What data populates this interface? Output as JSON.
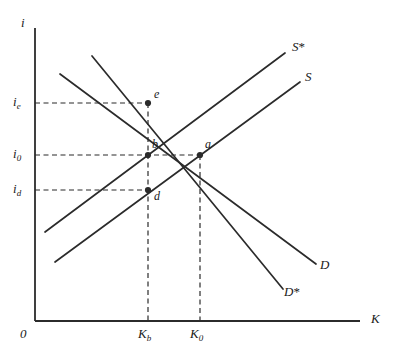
{
  "figure": {
    "type": "economics-supply-demand-diagram",
    "background_color": "#ffffff",
    "line_color": "#2b2b2b",
    "axes": {
      "y_label": "i",
      "x_label": "K",
      "origin_label": "0",
      "y_axis_x_px": 35,
      "y_axis_top_px": 28,
      "x_axis_y_px": 321,
      "x_axis_right_px": 360
    },
    "y_ticks": [
      {
        "id": "i_e",
        "base": "i",
        "sub": "e",
        "y_px": 103,
        "label": "i_e"
      },
      {
        "id": "i_0",
        "base": "i",
        "sub": "0",
        "y_px": 155,
        "label": "i_0"
      },
      {
        "id": "i_d",
        "base": "i",
        "sub": "d",
        "y_px": 190,
        "label": "i_d"
      }
    ],
    "x_ticks": [
      {
        "id": "K_b",
        "base": "K",
        "sub": "b",
        "x_px": 148,
        "label": "K_b"
      },
      {
        "id": "K_0",
        "base": "K",
        "sub": "0",
        "x_px": 200,
        "label": "K_0"
      }
    ],
    "curves": [
      {
        "id": "S_star",
        "label": "S*",
        "base": "S",
        "star": "*",
        "kind": "supply",
        "x1": 45,
        "y1": 232,
        "x2": 285,
        "y2": 53,
        "label_x": 292,
        "label_y": 40
      },
      {
        "id": "S",
        "label": "S",
        "base": "S",
        "star": "",
        "kind": "supply",
        "x1": 55,
        "y1": 262,
        "x2": 300,
        "y2": 82,
        "label_x": 305,
        "label_y": 70
      },
      {
        "id": "D",
        "label": "D",
        "base": "D",
        "star": "",
        "kind": "demand",
        "x1": 60,
        "y1": 74,
        "x2": 316,
        "y2": 264,
        "label_x": 320,
        "label_y": 258
      },
      {
        "id": "D_star",
        "label": "D*",
        "base": "D",
        "star": "*",
        "kind": "demand",
        "x1": 92,
        "y1": 56,
        "x2": 283,
        "y2": 289,
        "label_x": 284,
        "label_y": 285
      }
    ],
    "points": [
      {
        "id": "e",
        "label": "e",
        "x": 148,
        "y": 103,
        "label_x": 154,
        "label_y": 88
      },
      {
        "id": "b",
        "label": "b",
        "x": 148,
        "y": 155,
        "label_x": 152,
        "label_y": 138
      },
      {
        "id": "a",
        "label": "a",
        "x": 200,
        "y": 155,
        "label_x": 205,
        "label_y": 138
      },
      {
        "id": "d",
        "label": "d",
        "x": 148,
        "y": 190,
        "label_x": 154,
        "label_y": 190
      }
    ],
    "guides": {
      "horizontal": [
        {
          "id": "guide-i_e",
          "y": 103,
          "x_from": 35,
          "x_to": 148
        },
        {
          "id": "guide-i_0",
          "y": 155,
          "x_from": 35,
          "x_to": 200
        },
        {
          "id": "guide-i_d",
          "y": 190,
          "x_from": 35,
          "x_to": 148
        }
      ],
      "vertical": [
        {
          "id": "guide-K_b",
          "x": 148,
          "y_from": 103,
          "y_to": 321
        },
        {
          "id": "guide-K_0",
          "x": 200,
          "y_from": 155,
          "y_to": 321
        }
      ]
    }
  }
}
